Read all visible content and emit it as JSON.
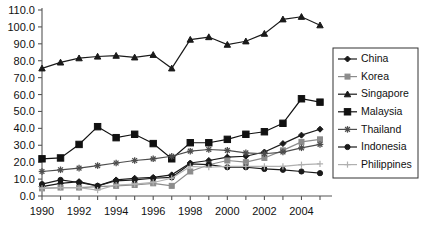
{
  "chart_data": {
    "type": "line",
    "title": "",
    "xlabel": "",
    "ylabel": "",
    "x": [
      1990,
      1991,
      1992,
      1993,
      1994,
      1995,
      1996,
      1997,
      1998,
      1999,
      2000,
      2001,
      2002,
      2003,
      2004,
      2005
    ],
    "x_tick_labels": [
      "1990",
      "1992",
      "1994",
      "1996",
      "1998",
      "2000",
      "2002",
      "2004"
    ],
    "x_tick_values": [
      1990,
      1992,
      1994,
      1996,
      1998,
      2000,
      2002,
      2004
    ],
    "y_tick_labels": [
      "0.0",
      "10.0",
      "20.0",
      "30.0",
      "40.0",
      "50.0",
      "60.0",
      "70.0",
      "80.0",
      "90.0",
      "100.0",
      "110.0"
    ],
    "y_tick_values": [
      0,
      10,
      20,
      30,
      40,
      50,
      60,
      70,
      80,
      90,
      100,
      110
    ],
    "ylim": [
      0,
      110
    ],
    "xlim": [
      1990,
      2005
    ],
    "grid": false,
    "legend_position": "right",
    "series": [
      {
        "name": "China",
        "marker": "diamond",
        "color": "#1a1a1a",
        "values": [
          5.5,
          7.5,
          8.5,
          6.0,
          9.5,
          10.5,
          11.0,
          12.5,
          19.5,
          21.0,
          23.0,
          23.5,
          26.0,
          31.0,
          36.0,
          39.5
        ]
      },
      {
        "name": "Korea",
        "marker": "square-gray",
        "color": "#8c8c8c",
        "values": [
          4.5,
          5.0,
          5.0,
          5.5,
          6.0,
          6.5,
          7.5,
          6.0,
          14.5,
          18.5,
          21.0,
          20.0,
          22.5,
          27.0,
          32.0,
          33.5
        ]
      },
      {
        "name": "Singapore",
        "marker": "triangle",
        "color": "#1a1a1a",
        "values": [
          75.5,
          79.0,
          81.5,
          82.5,
          83.0,
          82.0,
          83.5,
          75.5,
          92.5,
          94.0,
          89.5,
          91.5,
          96.0,
          104.5,
          106.0,
          101.0
        ]
      },
      {
        "name": "Malaysia",
        "marker": "square",
        "color": "#111111",
        "values": [
          22.0,
          22.5,
          30.5,
          41.0,
          34.5,
          36.5,
          31.0,
          22.0,
          31.5,
          31.5,
          33.5,
          36.5,
          38.0,
          43.0,
          57.5,
          55.5
        ]
      },
      {
        "name": "Thailand",
        "marker": "asterisk",
        "color": "#4d4d4d",
        "values": [
          14.5,
          15.5,
          16.5,
          18.0,
          19.5,
          21.0,
          22.0,
          23.5,
          26.5,
          27.5,
          27.0,
          25.5,
          25.0,
          26.0,
          28.5,
          30.5
        ]
      },
      {
        "name": "Indonesia",
        "marker": "circle",
        "color": "#1a1a1a",
        "values": [
          7.0,
          9.5,
          8.0,
          6.0,
          9.0,
          9.5,
          10.5,
          11.0,
          19.0,
          18.5,
          17.0,
          17.0,
          16.0,
          15.5,
          14.5,
          13.5
        ]
      },
      {
        "name": "Philippines",
        "marker": "plus",
        "color": "#b0b0b0",
        "values": [
          4.5,
          5.0,
          5.0,
          3.5,
          6.5,
          7.0,
          8.0,
          10.5,
          17.5,
          17.0,
          17.5,
          17.5,
          17.5,
          17.5,
          18.5,
          19.0
        ]
      }
    ]
  }
}
